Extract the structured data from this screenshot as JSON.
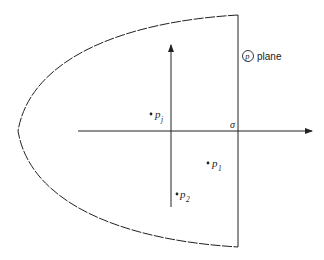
{
  "diagram": {
    "plane_label": {
      "symbol": "p",
      "text": "plane"
    },
    "axis_label": "σ",
    "points": [
      {
        "name": "p",
        "sub": "j",
        "x": 151,
        "y": 114
      },
      {
        "name": "p",
        "sub": "1",
        "x": 208,
        "y": 163
      },
      {
        "name": "p",
        "sub": "2",
        "x": 177,
        "y": 194
      }
    ],
    "colors": {
      "line": "#222222",
      "background": "#ffffff"
    }
  }
}
